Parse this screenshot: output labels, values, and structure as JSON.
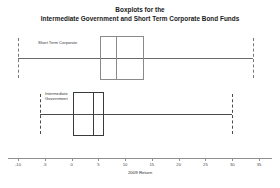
{
  "title": {
    "line1": "Boxplots for the",
    "line2": "Intermediate Government and Short Term Corporate Bond Funds"
  },
  "axis": {
    "label": "2009 Return",
    "ticks": [
      "-10",
      "-5",
      "0",
      "5",
      "10",
      "15",
      "20",
      "25",
      "30",
      "35"
    ]
  },
  "series": [
    {
      "name": "Short Term Corporate",
      "label": "Short Term Corporate"
    },
    {
      "name": "Intermediate Government",
      "label": "Intermediate\nGovernment"
    }
  ],
  "chart_data": {
    "type": "boxplot",
    "title": "Boxplots for the Intermediate Government and Short Term Corporate Bond Funds",
    "xlabel": "2009 Return",
    "ylabel": "",
    "xlim": [
      -10,
      35
    ],
    "xticks": [
      -10,
      -5,
      0,
      5,
      10,
      15,
      20,
      25,
      30,
      35
    ],
    "grid": false,
    "legend": "none",
    "orientation": "horizontal",
    "boxes": [
      {
        "name": "Short Term Corporate",
        "whisker_low": -10,
        "q1": 0.5,
        "median": 3.0,
        "q3": 8.5,
        "whisker_high": 34.0
      },
      {
        "name": "Intermediate Government",
        "whisker_low": -6.0,
        "q1": 0.2,
        "median": 3.7,
        "q3": 6.0,
        "whisker_high": 30.0
      }
    ]
  }
}
